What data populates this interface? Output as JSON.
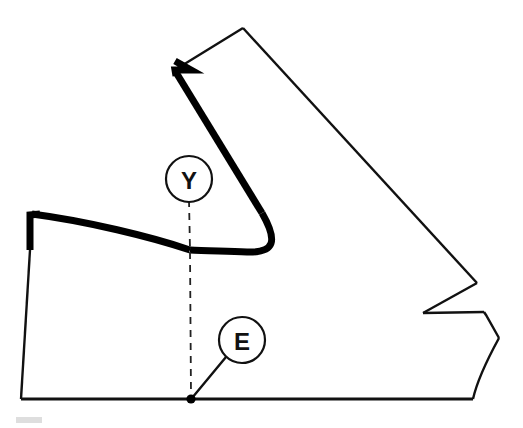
{
  "figure": {
    "background_color": "#ffffff",
    "line_color": "#111111",
    "thick_line_color": "#000000",
    "thin_stroke_width": 2.2,
    "thick_stroke_width": 7,
    "dashed_stroke_width": 1.6,
    "dash_pattern": "7,6",
    "faint_mark_color": "#d9d9d9"
  },
  "callouts": [
    {
      "id": "Y",
      "label": "Y",
      "circle": {
        "cx": 189,
        "cy": 179,
        "r": 23
      },
      "leader": {
        "x1": 189,
        "y1": 202,
        "x2": 190,
        "y2": 250
      },
      "leader_style": "dashed"
    },
    {
      "id": "E",
      "label": "E",
      "circle": {
        "cx": 242,
        "cy": 340,
        "r": 23
      },
      "leader": {
        "x1": 226,
        "y1": 357,
        "x2": 192,
        "y2": 399
      },
      "leader_style": "solid"
    }
  ],
  "axis": {
    "name": "vertical-center-dashed-axis",
    "x1": 190,
    "y1": 250,
    "x2": 191,
    "y2": 399,
    "style": "dashed"
  },
  "vertex_point": {
    "name": "origin-point-E",
    "cx": 191,
    "cy": 399,
    "r": 4.5
  },
  "paths": {
    "outline_thin": "M 26,212 L 21,399 L 473,399 C 483,380 492,360 499,338 L 484,313 L 423,313 L 477,283 L 243,28 L 177,70 L 176,62",
    "outline_top_right": "M 243,28 L 477,283",
    "thick_upper": "M 176,63 L 190,72 L 176,71 L 262,215 C 276,238 272,252 248,252 C 222,252 200,250 190,250",
    "thick_lower_left": "M 26,213 L 33,213 L 33,250 L 26,250 L 26,213 Z",
    "thick_left_sweep": "M 30,214 C 80,219 150,236 190,250",
    "notch_detail": "M 423,313 L 477,283",
    "bottom_edge": "M 21,399 L 473,399"
  },
  "faint_mark": {
    "x": 16,
    "y": 417,
    "width": 26,
    "height": 6
  }
}
